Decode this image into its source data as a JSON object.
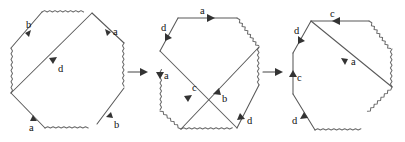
{
  "figure": {
    "stroke_color": "#595959",
    "label_color": "#111111",
    "background": "#ffffff"
  },
  "octagons": [
    {
      "id": "octagon-1",
      "name": "first-octagon",
      "center": {
        "x": 67,
        "y": 71
      },
      "radius": 60,
      "wavy_edges": [
        "left",
        "bottom",
        "top",
        "lower-right"
      ],
      "labels": [
        {
          "key": "b-top-left",
          "text": "b",
          "x": 30,
          "y": 36,
          "arrow": "up-right"
        },
        {
          "key": "a-top-right",
          "text": "a",
          "x": 114,
          "y": 37,
          "arrow": "down-right"
        },
        {
          "key": "d-diagonal",
          "text": "d",
          "x": 62,
          "y": 71,
          "arrow": "down-left"
        },
        {
          "key": "a-bottom-left",
          "text": "a",
          "x": 34,
          "y": 126,
          "arrow": "up-right"
        },
        {
          "key": "b-bottom-right",
          "text": "b",
          "x": 114,
          "y": 126,
          "arrow": "up-right"
        }
      ],
      "diagonals": [
        {
          "key": "d",
          "from": "top-right-vertex",
          "to": "left-lower-vertex",
          "label": "d"
        }
      ]
    },
    {
      "id": "octagon-2",
      "name": "second-octagon",
      "center": {
        "x": 202,
        "y": 71
      },
      "radius": 60,
      "wavy_edges": [
        "left",
        "bottom",
        "upper-right",
        "lower-right"
      ],
      "labels": [
        {
          "key": "a-top",
          "text": "a",
          "x": 200,
          "y": 15,
          "arrow": "right"
        },
        {
          "key": "d-top-left",
          "text": "d",
          "x": 165,
          "y": 36,
          "arrow": "down-right"
        },
        {
          "key": "a-left",
          "text": "a",
          "x": 159,
          "y": 74,
          "arrow": "down"
        },
        {
          "key": "c-diagonal",
          "text": "c",
          "x": 190,
          "y": 87,
          "arrow": "down-left"
        },
        {
          "key": "b-diagonal",
          "text": "b",
          "x": 221,
          "y": 98,
          "arrow": "up-right"
        },
        {
          "key": "d-lower-right",
          "text": "d",
          "x": 246,
          "y": 122,
          "arrow": "down-right"
        }
      ],
      "diagonals": [
        {
          "key": "c",
          "from": "upper-right-vertex",
          "to": "bottom-left-vertex",
          "label": "c"
        },
        {
          "key": "b",
          "from": "upper-left-vertex",
          "to": "bottom-right-vertex",
          "label": "b"
        }
      ]
    },
    {
      "id": "octagon-3",
      "name": "third-octagon",
      "center": {
        "x": 336,
        "y": 71
      },
      "radius": 60,
      "wavy_edges": [
        "upper-right",
        "lower-right",
        "bottom"
      ],
      "labels": [
        {
          "key": "c-top",
          "text": "c",
          "x": 330,
          "y": 15,
          "arrow": "left"
        },
        {
          "key": "d-top-left",
          "text": "d",
          "x": 298,
          "y": 36,
          "arrow": "down-right"
        },
        {
          "key": "a-diagonal",
          "text": "a",
          "x": 352,
          "y": 62,
          "arrow": "down-right"
        },
        {
          "key": "c-left",
          "text": "c",
          "x": 295,
          "y": 77,
          "arrow": "up"
        },
        {
          "key": "d-bottom-left",
          "text": "d",
          "x": 296,
          "y": 122,
          "arrow": "up-right"
        }
      ],
      "diagonals": [
        {
          "key": "a",
          "from": "top-left-vertex",
          "to": "right-lower-vertex",
          "label": "a"
        }
      ]
    }
  ],
  "connectors": [
    {
      "id": "connector-1",
      "name": "arrow-octagon1-to-octagon2",
      "from": "octagon-1",
      "to": "octagon-2",
      "x1": 124,
      "x2": 150,
      "y": 72,
      "direction": "right"
    },
    {
      "id": "connector-2",
      "name": "arrow-octagon2-to-octagon3",
      "from": "octagon-2",
      "to": "octagon-3",
      "x1": 259,
      "x2": 285,
      "y": 72,
      "direction": "right"
    }
  ]
}
